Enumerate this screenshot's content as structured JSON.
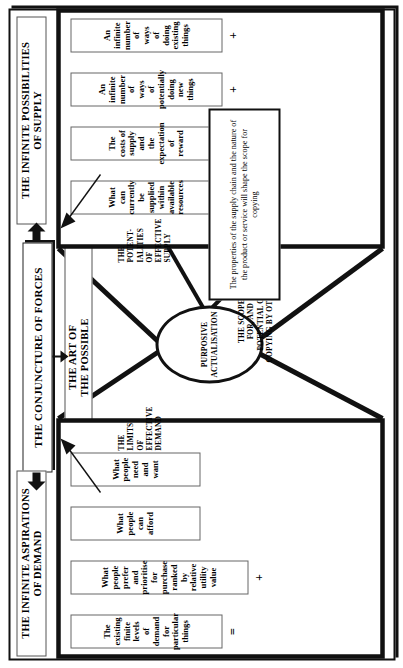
{
  "diagram": {
    "title": "THE CONJUNCTURE OF FORCES",
    "subtitle": "THE ART OF\nTHE POSSIBLE",
    "center_node": {
      "line1": "PURPOSIVE",
      "line2": "ACTUALISATION"
    },
    "supply": {
      "header": "THE INFINITE POSSIBILITIES\nOF SUPPLY",
      "tie_label": "THE\nPOTENT-\nIALITIES\nOF\nEFFECTIVE\nSUPPLY",
      "items": [
        {
          "text": "An\ninfinite\nnumber\nof\nways\nof\ndoing\nexisting\nthings",
          "operator": "+"
        },
        {
          "text": "An\ninfinite\nnumber\nof\nways\nof\npotentially\ndoing\nnew\nthings",
          "operator": "+"
        },
        {
          "text": "The\ncosts of\nsupply\nand\nthe\nexpectation\nof\nreward",
          "operator": "="
        },
        {
          "text": "What\ncan\ncurrently\nbe\nsupplied\nwithin\navailable\nresources",
          "operator": ""
        }
      ]
    },
    "demand": {
      "header": "THE INFINITE ASPIRATIONS\nOF DEMAND",
      "tie_label": "THE\nLIMITS\nOF\nEFFECTIVE\nDEMAND",
      "items": [
        {
          "text": "The\nexisting\nfinite\nlevels\nof\ndemand\nfor\nparticular\nthings",
          "operator": "="
        },
        {
          "text": "What\npeople\nprefer\nand\nprioritise\nfor\npurchase\nranked\nby\nrelative\nutility\nvalue",
          "operator": "+"
        },
        {
          "text": "What\npeople\ncan\nafford",
          "operator": "+"
        },
        {
          "text": "What\npeople\nneed\nand\nwant",
          "operator": ""
        }
      ]
    },
    "copying": {
      "tie_label": "THE SCOPE\nFOR, AND\nPOTENTIAL OF,\nCOPYING BY OTHERS",
      "note": "The properties of the supply chain and the nature of the product or service will shape the scope for copying"
    },
    "colors": {
      "ink": "#111111",
      "rule": "#666666",
      "paper": "#ffffff"
    }
  }
}
